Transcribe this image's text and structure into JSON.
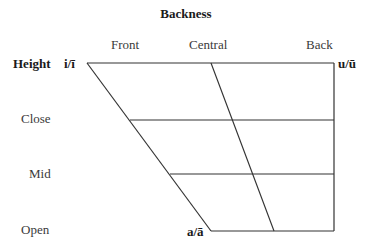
{
  "title": "Backness",
  "backness_labels": {
    "front": "Front",
    "central": "Central",
    "back": "Back"
  },
  "height_label": "Height",
  "height_levels": {
    "close": "Close",
    "mid": "Mid",
    "open": "Open"
  },
  "vowels": {
    "front_high": "i/ī",
    "back_high": "u/ū",
    "open_low": "a/ā"
  },
  "colors": {
    "line": "#333333",
    "text": "#3a3a3a"
  }
}
